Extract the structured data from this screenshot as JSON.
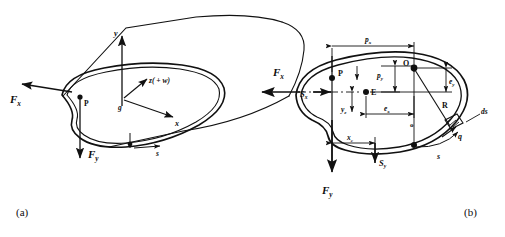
{
  "figure": {
    "background": "#ffffff",
    "line_color": "#111111",
    "panels": [
      {
        "id": "a",
        "caption": "(a)",
        "description": "Pictorial view of a thin-walled closed cylindrical member with applied shear forces",
        "labels": {
          "axis_y": "y",
          "axis_x": "x",
          "axis_z": "z( + w)",
          "origin": "g",
          "point_p": "P",
          "force_fx": "F",
          "force_fx_sub": "x",
          "force_fy": "F",
          "force_fy_sub": "y",
          "arc_coord": "s"
        }
      },
      {
        "id": "b",
        "caption": "(b)",
        "description": "Cross-section showing shear centre E, centroid O, pole P, radius R and wall element ds",
        "labels": {
          "point_p": "P",
          "point_o_upper": "O",
          "point_o_lower": "o",
          "point_e": "E",
          "force_fx": "F",
          "force_fx_sub": "x",
          "force_fy": "F",
          "force_fy_sub": "y",
          "shear_sx": "S",
          "shear_sx_sub": "x",
          "shear_sy": "S",
          "shear_sy_sub": "y",
          "dim_px": "p",
          "dim_px_sub": "x",
          "dim_py": "p",
          "dim_py_sub": "y",
          "ecc_ex": "e",
          "ecc_ex_sub": "x",
          "ecc_ey": "e",
          "ecc_ey_sub": "y",
          "dim_ye": "y",
          "dim_ye_sub": "e",
          "dim_xc": "x",
          "dim_xc_sub": "c",
          "radius": "R",
          "shear_flow": "q",
          "wall_element": "ds",
          "arc_coord": "s"
        }
      }
    ]
  }
}
